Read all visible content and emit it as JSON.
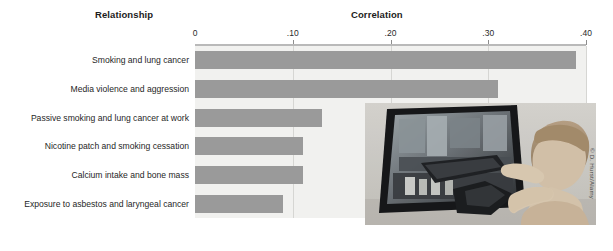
{
  "figure": {
    "headers": {
      "relationship": "Relationship",
      "correlation": "Correlation"
    },
    "photo_credit": "© D. Hurst/Alamy",
    "photo_alt": "child-playing-arcade-shooting-game"
  },
  "chart_data": {
    "type": "bar",
    "orientation": "horizontal",
    "title": "Correlation",
    "xlabel": "Correlation",
    "ylabel": "Relationship",
    "xlim": [
      0,
      0.4
    ],
    "grid": true,
    "legend": "none",
    "tick_labels": [
      "0",
      ".10",
      ".20",
      ".30",
      ".40"
    ],
    "tick_values": [
      0,
      0.1,
      0.2,
      0.3,
      0.4
    ],
    "categories": [
      "Smoking and lung cancer",
      "Media violence and aggression",
      "Passive smoking and lung cancer at work",
      "Nicotine patch and smoking cessation",
      "Calcium intake and bone mass",
      "Exposure to asbestos and laryngeal cancer"
    ],
    "values": [
      0.39,
      0.31,
      0.13,
      0.11,
      0.11,
      0.09
    ],
    "bar_color": "#9a9a9a",
    "plot_background": "#f1f1ef"
  }
}
